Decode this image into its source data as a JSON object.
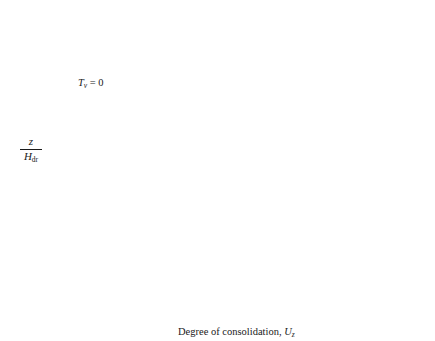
{
  "chart_data": {
    "type": "line",
    "title": "",
    "xlabel": "Degree of consolidation, U_z",
    "ylabel": "z / H_dr",
    "xlim": [
      0.0,
      1.0
    ],
    "ylim": [
      0.0,
      2.0
    ],
    "grid": false,
    "legend_position": "inline-labels",
    "xticks": [
      "0.0",
      "0.1",
      "0.2",
      "0.3",
      "0.4",
      "0.5",
      "0.6",
      "0.7",
      "0.8",
      "0.9",
      "1.0"
    ],
    "yticks": [
      "0.0",
      "0.5",
      "1.0",
      "1.5",
      "2.0"
    ],
    "annotations": [
      {
        "text": "Tv = 0",
        "target_x": 0.0,
        "target_y": 1.45,
        "label_x": 0.14,
        "label_y": 1.58
      }
    ],
    "series": [
      {
        "name": "0.1",
        "time_factor": 0.1,
        "label_x": 0.255,
        "label_y": 1.68,
        "label_mode": "inline",
        "points": [
          [
            1.0,
            2.0
          ],
          [
            0.8,
            1.9
          ],
          [
            0.58,
            1.8
          ],
          [
            0.4,
            1.7
          ],
          [
            0.27,
            1.6
          ],
          [
            0.185,
            1.5
          ],
          [
            0.125,
            1.4
          ],
          [
            0.087,
            1.3
          ],
          [
            0.066,
            1.2
          ],
          [
            0.056,
            1.1
          ],
          [
            0.053,
            1.0
          ],
          [
            0.056,
            0.9
          ],
          [
            0.066,
            0.8
          ],
          [
            0.087,
            0.7
          ],
          [
            0.125,
            0.6
          ],
          [
            0.185,
            0.5
          ],
          [
            0.27,
            0.4
          ],
          [
            0.4,
            0.3
          ],
          [
            0.58,
            0.2
          ],
          [
            0.8,
            0.1
          ],
          [
            1.0,
            0.0
          ]
        ]
      },
      {
        "name": "0.2",
        "time_factor": 0.2,
        "label_x": 0.385,
        "label_y": 1.5,
        "label_mode": "inline",
        "points": [
          [
            1.0,
            2.0
          ],
          [
            0.855,
            1.9
          ],
          [
            0.715,
            1.8
          ],
          [
            0.585,
            1.7
          ],
          [
            0.475,
            1.6
          ],
          [
            0.385,
            1.5
          ],
          [
            0.315,
            1.4
          ],
          [
            0.27,
            1.3
          ],
          [
            0.243,
            1.2
          ],
          [
            0.23,
            1.1
          ],
          [
            0.228,
            1.0
          ],
          [
            0.23,
            0.9
          ],
          [
            0.243,
            0.8
          ],
          [
            0.27,
            0.7
          ],
          [
            0.315,
            0.6
          ],
          [
            0.385,
            0.5
          ],
          [
            0.475,
            0.4
          ],
          [
            0.585,
            0.3
          ],
          [
            0.715,
            0.2
          ],
          [
            0.855,
            0.1
          ],
          [
            1.0,
            0.0
          ]
        ]
      },
      {
        "name": "0.3",
        "time_factor": 0.3,
        "label_x": 0.495,
        "label_y": 1.38,
        "label_mode": "inline",
        "points": [
          [
            1.0,
            2.0
          ],
          [
            0.895,
            1.9
          ],
          [
            0.795,
            1.8
          ],
          [
            0.705,
            1.7
          ],
          [
            0.628,
            1.6
          ],
          [
            0.565,
            1.5
          ],
          [
            0.517,
            1.4
          ],
          [
            0.483,
            1.3
          ],
          [
            0.463,
            1.2
          ],
          [
            0.453,
            1.1
          ],
          [
            0.45,
            1.0
          ],
          [
            0.453,
            0.9
          ],
          [
            0.463,
            0.8
          ],
          [
            0.483,
            0.7
          ],
          [
            0.517,
            0.6
          ],
          [
            0.565,
            0.5
          ],
          [
            0.628,
            0.4
          ],
          [
            0.705,
            0.3
          ],
          [
            0.795,
            0.2
          ],
          [
            0.895,
            0.1
          ],
          [
            1.0,
            0.0
          ]
        ]
      },
      {
        "name": "0.4",
        "time_factor": 0.4,
        "label_x": 0.605,
        "label_y": 1.28,
        "label_mode": "inline",
        "points": [
          [
            1.0,
            2.0
          ],
          [
            0.925,
            1.9
          ],
          [
            0.855,
            1.8
          ],
          [
            0.792,
            1.7
          ],
          [
            0.74,
            1.6
          ],
          [
            0.697,
            1.5
          ],
          [
            0.663,
            1.4
          ],
          [
            0.64,
            1.3
          ],
          [
            0.626,
            1.2
          ],
          [
            0.619,
            1.1
          ],
          [
            0.617,
            1.0
          ],
          [
            0.619,
            0.9
          ],
          [
            0.626,
            0.8
          ],
          [
            0.64,
            0.7
          ],
          [
            0.663,
            0.6
          ],
          [
            0.697,
            0.5
          ],
          [
            0.74,
            0.4
          ],
          [
            0.792,
            0.3
          ],
          [
            0.855,
            0.2
          ],
          [
            0.925,
            0.1
          ],
          [
            1.0,
            0.0
          ]
        ]
      },
      {
        "name": "0.5",
        "time_factor": 0.5,
        "label_x": 0.7,
        "label_y": 1.18,
        "label_mode": "inline",
        "points": [
          [
            1.0,
            2.0
          ],
          [
            0.948,
            1.9
          ],
          [
            0.899,
            1.8
          ],
          [
            0.856,
            1.7
          ],
          [
            0.82,
            1.6
          ],
          [
            0.79,
            1.5
          ],
          [
            0.767,
            1.4
          ],
          [
            0.751,
            1.3
          ],
          [
            0.741,
            1.2
          ],
          [
            0.736,
            1.1
          ],
          [
            0.735,
            1.0
          ],
          [
            0.736,
            0.9
          ],
          [
            0.741,
            0.8
          ],
          [
            0.751,
            0.7
          ],
          [
            0.767,
            0.6
          ],
          [
            0.79,
            0.5
          ],
          [
            0.82,
            0.4
          ],
          [
            0.856,
            0.3
          ],
          [
            0.899,
            0.2
          ],
          [
            0.948,
            0.1
          ],
          [
            1.0,
            0.0
          ]
        ]
      },
      {
        "name": "0.6",
        "time_factor": 0.6,
        "label_x": 0.79,
        "label_y": 1.07,
        "label_mode": "inline",
        "points": [
          [
            1.0,
            2.0
          ],
          [
            0.964,
            1.9
          ],
          [
            0.93,
            1.8
          ],
          [
            0.901,
            1.7
          ],
          [
            0.876,
            1.6
          ],
          [
            0.855,
            1.5
          ],
          [
            0.84,
            1.4
          ],
          [
            0.829,
            1.3
          ],
          [
            0.822,
            1.2
          ],
          [
            0.818,
            1.1
          ],
          [
            0.817,
            1.0
          ],
          [
            0.818,
            0.9
          ],
          [
            0.822,
            0.8
          ],
          [
            0.829,
            0.7
          ],
          [
            0.84,
            0.6
          ],
          [
            0.855,
            0.5
          ],
          [
            0.876,
            0.4
          ],
          [
            0.901,
            0.3
          ],
          [
            0.93,
            0.2
          ],
          [
            0.964,
            0.1
          ],
          [
            1.0,
            0.0
          ]
        ]
      },
      {
        "name": "0.7",
        "time_factor": 0.7,
        "label_x": 1.045,
        "label_y": 1.54,
        "label_mode": "arrow",
        "arrow_target_x": 0.888,
        "arrow_target_y": 1.42,
        "points": [
          [
            1.0,
            2.0
          ],
          [
            0.976,
            1.9
          ],
          [
            0.953,
            1.8
          ],
          [
            0.934,
            1.7
          ],
          [
            0.917,
            1.6
          ],
          [
            0.904,
            1.5
          ],
          [
            0.893,
            1.4
          ],
          [
            0.886,
            1.3
          ],
          [
            0.881,
            1.2
          ],
          [
            0.879,
            1.1
          ],
          [
            0.878,
            1.0
          ],
          [
            0.879,
            0.9
          ],
          [
            0.881,
            0.8
          ],
          [
            0.886,
            0.7
          ],
          [
            0.893,
            0.6
          ],
          [
            0.904,
            0.5
          ],
          [
            0.917,
            0.4
          ],
          [
            0.934,
            0.3
          ],
          [
            0.953,
            0.2
          ],
          [
            0.976,
            0.1
          ],
          [
            1.0,
            0.0
          ]
        ]
      },
      {
        "name": "0.8",
        "time_factor": 0.8,
        "label_x": 1.045,
        "label_y": 1.29,
        "label_mode": "arrow",
        "arrow_target_x": 0.925,
        "arrow_target_y": 1.12,
        "points": [
          [
            1.0,
            2.0
          ],
          [
            0.984,
            1.9
          ],
          [
            0.969,
            1.8
          ],
          [
            0.956,
            1.7
          ],
          [
            0.945,
            1.6
          ],
          [
            0.936,
            1.5
          ],
          [
            0.929,
            1.4
          ],
          [
            0.924,
            1.3
          ],
          [
            0.921,
            1.2
          ],
          [
            0.919,
            1.1
          ],
          [
            0.919,
            1.0
          ],
          [
            0.919,
            0.9
          ],
          [
            0.921,
            0.8
          ],
          [
            0.924,
            0.7
          ],
          [
            0.929,
            0.6
          ],
          [
            0.936,
            0.5
          ],
          [
            0.945,
            0.4
          ],
          [
            0.956,
            0.3
          ],
          [
            0.969,
            0.2
          ],
          [
            0.984,
            0.1
          ],
          [
            1.0,
            0.0
          ]
        ]
      },
      {
        "name": "0.9",
        "time_factor": 0.9,
        "label_x": 1.045,
        "label_y": 1.05,
        "label_mode": "arrow",
        "arrow_target_x": 0.952,
        "arrow_target_y": 0.95,
        "points": [
          [
            1.0,
            2.0
          ],
          [
            0.99,
            1.9
          ],
          [
            0.981,
            1.8
          ],
          [
            0.973,
            1.7
          ],
          [
            0.966,
            1.6
          ],
          [
            0.96,
            1.5
          ],
          [
            0.956,
            1.4
          ],
          [
            0.953,
            1.3
          ],
          [
            0.951,
            1.2
          ],
          [
            0.95,
            1.1
          ],
          [
            0.95,
            1.0
          ],
          [
            0.95,
            0.9
          ],
          [
            0.951,
            0.8
          ],
          [
            0.953,
            0.7
          ],
          [
            0.956,
            0.6
          ],
          [
            0.96,
            0.5
          ],
          [
            0.966,
            0.4
          ],
          [
            0.973,
            0.3
          ],
          [
            0.981,
            0.2
          ],
          [
            0.99,
            0.1
          ],
          [
            1.0,
            0.0
          ]
        ]
      }
    ]
  },
  "style": {
    "axis_color": "#1a1a1a",
    "curve_color": "#3a3a3a",
    "background": "#ffffff"
  }
}
